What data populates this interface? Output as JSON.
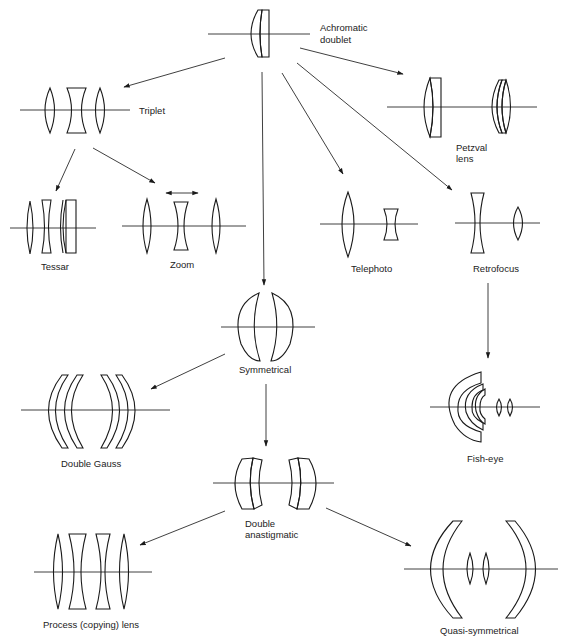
{
  "nodes": [
    {
      "id": "achromatic-doublet",
      "label_lines": [
        "Achromatic",
        "doublet"
      ]
    },
    {
      "id": "triplet",
      "label_lines": [
        "Triplet"
      ]
    },
    {
      "id": "petzval",
      "label_lines": [
        "Petzval",
        "lens"
      ]
    },
    {
      "id": "tessar",
      "label_lines": [
        "Tessar"
      ]
    },
    {
      "id": "zoom",
      "label_lines": [
        "Zoom"
      ]
    },
    {
      "id": "telephoto",
      "label_lines": [
        "Telephoto"
      ]
    },
    {
      "id": "retrofocus",
      "label_lines": [
        "Retrofocus"
      ]
    },
    {
      "id": "symmetrical",
      "label_lines": [
        "Symmetrical"
      ]
    },
    {
      "id": "double-gauss",
      "label_lines": [
        "Double Gauss"
      ]
    },
    {
      "id": "fish-eye",
      "label_lines": [
        "Fish-eye"
      ]
    },
    {
      "id": "double-anastigmatic",
      "label_lines": [
        "Double",
        "anastigmatic"
      ]
    },
    {
      "id": "process-lens",
      "label_lines": [
        "Process (copying) lens"
      ]
    },
    {
      "id": "quasi-symmetrical",
      "label_lines": [
        "Quasi-symmetrical"
      ]
    }
  ],
  "edges": [
    {
      "from": "achromatic-doublet",
      "to": "triplet"
    },
    {
      "from": "achromatic-doublet",
      "to": "petzval"
    },
    {
      "from": "achromatic-doublet",
      "to": "symmetrical"
    },
    {
      "from": "achromatic-doublet",
      "to": "telephoto"
    },
    {
      "from": "achromatic-doublet",
      "to": "retrofocus"
    },
    {
      "from": "triplet",
      "to": "tessar"
    },
    {
      "from": "triplet",
      "to": "zoom"
    },
    {
      "from": "retrofocus",
      "to": "fish-eye"
    },
    {
      "from": "symmetrical",
      "to": "double-gauss"
    },
    {
      "from": "symmetrical",
      "to": "double-anastigmatic"
    },
    {
      "from": "double-anastigmatic",
      "to": "process-lens"
    },
    {
      "from": "double-anastigmatic",
      "to": "quasi-symmetrical"
    }
  ],
  "annotations": [
    {
      "near": "zoom",
      "icon": "double-headed-arrow-icon",
      "meaning": "movable element"
    }
  ]
}
